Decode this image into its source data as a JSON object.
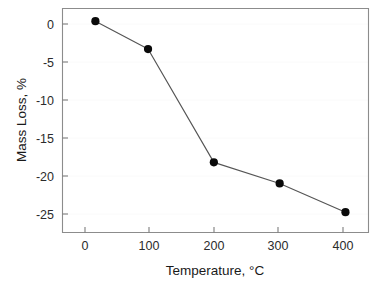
{
  "chart_data": {
    "type": "line",
    "title": "",
    "xlabel": "Temperature, °C",
    "ylabel": "Mass Loss, %",
    "xlim": [
      -30,
      435
    ],
    "ylim": [
      -25,
      1.5
    ],
    "xticks": [
      0,
      100,
      200,
      300,
      400
    ],
    "xtick_labels": [
      "0",
      "100",
      "200",
      "300",
      "400"
    ],
    "yticks": [
      0,
      -5,
      -10,
      -15,
      -20,
      -25
    ],
    "ytick_labels": [
      "0",
      "-5",
      "-10",
      "-15",
      "-20",
      "-25"
    ],
    "grid": "faint-horizontal",
    "legend": "none",
    "marker": "filled-circle",
    "marker_color": "#0a0a0a",
    "line_color": "#555555",
    "x": [
      20,
      100,
      200,
      300,
      400
    ],
    "values": [
      0.0,
      -3.3,
      -16.7,
      -19.2,
      -22.6
    ],
    "series": [
      {
        "name": "Mass Loss",
        "points": [
          {
            "x": 20,
            "y": 0.0
          },
          {
            "x": 100,
            "y": -3.3
          },
          {
            "x": 200,
            "y": -16.7
          },
          {
            "x": 300,
            "y": -19.2
          },
          {
            "x": 400,
            "y": -22.6
          }
        ]
      }
    ]
  },
  "axes": {
    "x_title": "Temperature, °C",
    "y_title": "Mass Loss, %",
    "x_tick_0": "0",
    "x_tick_1": "100",
    "x_tick_2": "200",
    "x_tick_3": "300",
    "x_tick_4": "400",
    "y_tick_0": "0",
    "y_tick_1": "-5",
    "y_tick_2": "-10",
    "y_tick_3": "-15",
    "y_tick_4": "-20",
    "y_tick_5": "-25"
  }
}
